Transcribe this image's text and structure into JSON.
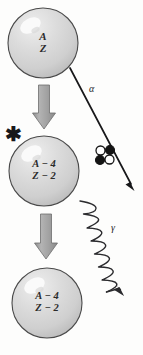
{
  "figure": {
    "background_color": "#fdfdfc",
    "width": 143,
    "height": 355
  },
  "nuclei": [
    {
      "id": "parent-nucleus",
      "line1": "A",
      "line2": "Z",
      "state": "ground",
      "cx": 43,
      "cy": 43,
      "r": 35,
      "fill": "#d2d2d2",
      "stroke": "#4a4a4a"
    },
    {
      "id": "daughter-nucleus-excited",
      "line1": "A − 4",
      "line2": "Z − 2",
      "state": "excited",
      "cx": 44,
      "cy": 171,
      "r": 35,
      "fill": "#d2d2d2",
      "stroke": "#4a4a4a"
    },
    {
      "id": "daughter-nucleus-ground",
      "line1": "A − 4",
      "line2": "Z − 2",
      "state": "ground",
      "cx": 47,
      "cy": 303,
      "r": 35,
      "fill": "#d2d2d2",
      "stroke": "#4a4a4a"
    }
  ],
  "excited_marker": {
    "symbol": "✱",
    "name": "excited-state-asterisk",
    "x": 5,
    "y": 124
  },
  "emissions": [
    {
      "id": "alpha-emission",
      "label": "α",
      "label_x": 89,
      "label_y": 83,
      "kind": "straight-arrow",
      "color": "#18181a"
    },
    {
      "id": "gamma-emission",
      "label": "γ",
      "label_x": 111,
      "label_y": 222,
      "kind": "wavy-arrow",
      "color": "#2b2b2e"
    }
  ],
  "alpha_particle": {
    "name": "alpha-particle-cluster",
    "nucleon_counts": {
      "protons": 2,
      "neutrons": 2
    },
    "proton_color": "#ffffff",
    "neutron_color": "#141414",
    "cx": 105,
    "cy": 155
  },
  "transition_arrows": [
    {
      "id": "decay-arrow-1",
      "x": 44,
      "y_top": 86,
      "y_bottom": 128,
      "fill": "#9e9e9e",
      "stroke": "#6e6e6e"
    },
    {
      "id": "decay-arrow-2",
      "x": 46,
      "y_top": 215,
      "y_bottom": 258,
      "fill": "#9e9e9e",
      "stroke": "#6e6e6e"
    }
  ],
  "colors": {
    "sphere_fill": "#d2d2d2",
    "sphere_stroke": "#4a4a4a",
    "arrow_gray": "#9e9e9e",
    "ink": "#18181a"
  }
}
